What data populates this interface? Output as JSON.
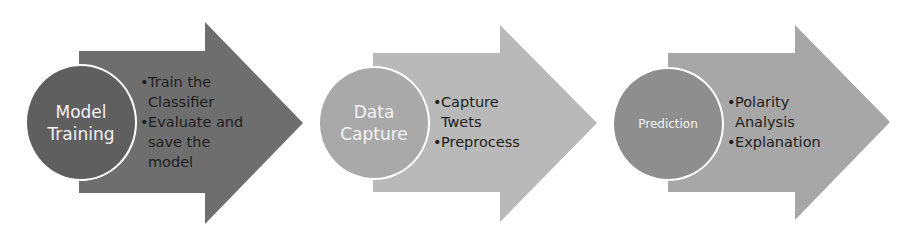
{
  "diagram": {
    "type": "process-flow",
    "stages": [
      {
        "title": "Model Training",
        "title_lines": [
          "Model",
          "Training"
        ],
        "bullets": [
          "Train the Classifier",
          "Evaluate and save the model"
        ],
        "arrow_color": "#6e6e6e",
        "circle_color": "#5f5f5f"
      },
      {
        "title": "Data Capture",
        "title_lines": [
          "Data",
          "Capture"
        ],
        "bullets": [
          "Capture Twets",
          "Preprocess"
        ],
        "arrow_color": "#b9b9b9",
        "circle_color": "#a9a9a9"
      },
      {
        "title": "Prediction",
        "title_lines": [
          "Prediction"
        ],
        "bullets": [
          "Polarity Analysis",
          "Explanation"
        ],
        "arrow_color": "#a7a7a7",
        "circle_color": "#8e8e8e"
      }
    ]
  }
}
